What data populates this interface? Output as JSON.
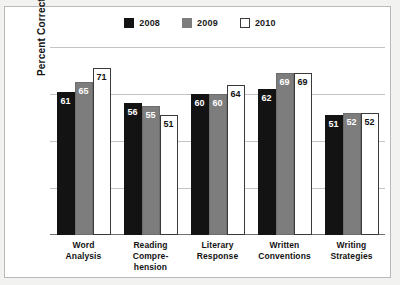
{
  "chart_data": {
    "type": "bar",
    "title": "",
    "xlabel": "",
    "ylabel": "Percent Correct",
    "ylim": [
      0,
      80
    ],
    "yticks": [
      "0",
      "20",
      "40",
      "60",
      "80"
    ],
    "grid": true,
    "legend_position": "top-center",
    "categories": [
      "Word\nAnalysis",
      "Reading\nCompre-\nhension",
      "Literary\nResponse",
      "Written\nConventions",
      "Writing\nStrategies"
    ],
    "series": [
      {
        "name": "2008",
        "color": "#131313",
        "values": [
          61,
          56,
          60,
          62,
          51
        ]
      },
      {
        "name": "2009",
        "color": "#7d7d7d",
        "values": [
          65,
          55,
          60,
          69,
          52
        ]
      },
      {
        "name": "2010",
        "color": "#ffffff",
        "values": [
          71,
          51,
          64,
          69,
          52
        ]
      }
    ]
  },
  "legend": {
    "items": [
      {
        "label": "2008",
        "color": "#131313"
      },
      {
        "label": "2009",
        "color": "#7d7d7d"
      },
      {
        "label": "2010",
        "color": "#ffffff"
      }
    ]
  },
  "axis": {
    "y_title": "Percent Correct",
    "y_ticks": [
      "80",
      "60",
      "40",
      "20",
      "0"
    ]
  },
  "categories": [
    {
      "lines": [
        "Word",
        "Analysis"
      ]
    },
    {
      "lines": [
        "Reading",
        "Compre-",
        "hension"
      ]
    },
    {
      "lines": [
        "Literary",
        "Response"
      ]
    },
    {
      "lines": [
        "Written",
        "Conventions"
      ]
    },
    {
      "lines": [
        "Writing",
        "Strategies"
      ]
    }
  ]
}
